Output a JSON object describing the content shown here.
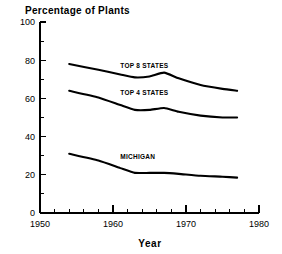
{
  "chart_data": {
    "type": "line",
    "title": "Percentage of Plants",
    "xlabel": "Year",
    "ylabel": "",
    "xlim": [
      1950,
      1980
    ],
    "ylim": [
      0,
      100
    ],
    "grid": false,
    "legend_position": "inline-labels",
    "x_major_ticks": [
      1950,
      1960,
      1970,
      1980
    ],
    "x_major_tick_labels": [
      "1950",
      "1960",
      "1970",
      "1980"
    ],
    "x_minor_tick_interval": 2,
    "y_major_ticks": [
      0,
      20,
      40,
      60,
      80,
      100
    ],
    "y_major_tick_labels": [
      "0",
      "20",
      "40",
      "60",
      "80",
      "100"
    ],
    "y_minor_tick_interval": 10,
    "x": [
      1954,
      1958,
      1961,
      1963,
      1965,
      1967,
      1969,
      1972,
      1975,
      1977
    ],
    "series": [
      {
        "name": "TOP 8 STATES",
        "label_x": 1961.0,
        "label_y": 76.0,
        "values": [
          78.0,
          75.0,
          72.5,
          71.0,
          71.5,
          73.5,
          70.5,
          67.0,
          65.0,
          64.0
        ]
      },
      {
        "name": "TOP 4 STATES",
        "label_x": 1961.0,
        "label_y": 62.0,
        "values": [
          64.0,
          60.5,
          56.5,
          54.0,
          54.0,
          55.0,
          53.0,
          51.0,
          50.0,
          50.0
        ]
      },
      {
        "name": "MICHIGAN",
        "label_x": 1961.0,
        "label_y": 28.5,
        "values": [
          31.0,
          27.5,
          23.5,
          21.0,
          21.0,
          21.0,
          20.5,
          19.5,
          19.0,
          18.5
        ]
      }
    ]
  },
  "colors": {
    "axis": "#000000",
    "line": "#000000",
    "background": "#ffffff",
    "text": "#000000"
  }
}
